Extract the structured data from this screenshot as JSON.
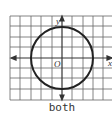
{
  "figure": {
    "caption": "both",
    "x_axis_label": "x",
    "y_axis_label": "y",
    "origin_label": "O",
    "grid": {
      "cols": 10,
      "rows": 9
    },
    "circle": {
      "center": [
        0,
        0
      ],
      "radius": 3
    },
    "colors": {
      "grid": "#555555",
      "curve": "#222222",
      "axes": "#333333"
    }
  }
}
